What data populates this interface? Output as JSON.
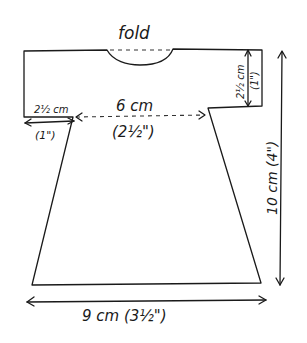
{
  "diagram": {
    "type": "sewing-pattern",
    "fold_label": "fold",
    "measurements": {
      "sleeve_width_cm": "2½ cm",
      "sleeve_width_in": "(1\")",
      "sleeve_length_cm": "2½ cm",
      "sleeve_length_in": "(1\")",
      "bodice_width_cm": "6 cm",
      "bodice_width_in": "(2½\")",
      "total_length": "10 cm (4\")",
      "hem_width": "9 cm (3½\")"
    },
    "colors": {
      "line": "#1a1a1a",
      "background": "#ffffff"
    }
  }
}
